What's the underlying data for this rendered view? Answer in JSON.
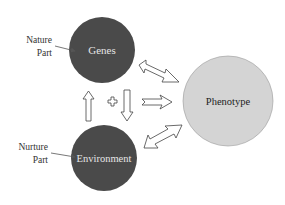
{
  "diagram": {
    "nodes": {
      "genes": {
        "label": "Genes",
        "fill": "#4a4a4a",
        "text_color": "#e6e6e6"
      },
      "environment": {
        "label": "Environment",
        "fill": "#4a4a4a",
        "text_color": "#e6e6e6"
      },
      "phenotype": {
        "label": "Phenotype",
        "fill": "#d4d4d4",
        "text_color": "#222222"
      }
    },
    "annotations": {
      "nature": {
        "line1": "Nature",
        "line2": "Part"
      },
      "nurture": {
        "line1": "Nurture",
        "line2": "Part"
      }
    },
    "operator": "+",
    "edges": [
      {
        "from": "genes",
        "to": "phenotype",
        "type": "bidirectional"
      },
      {
        "from": "environment",
        "to": "phenotype",
        "type": "bidirectional"
      },
      {
        "from": "genes+environment",
        "to": "phenotype",
        "type": "unidirectional"
      },
      {
        "from": "environment",
        "to": "genes",
        "type": "unidirectional-up"
      },
      {
        "from": "genes",
        "to": "environment",
        "type": "unidirectional-down"
      }
    ]
  }
}
